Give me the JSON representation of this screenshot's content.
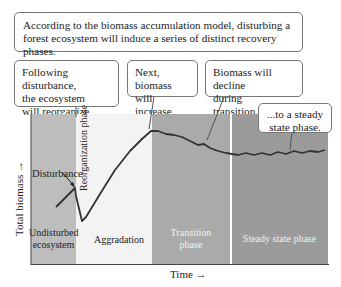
{
  "intro_box": {
    "text": "According to the biomass accumulation model, disturbing a forest ecosystem will induce a series of distinct recovery phases."
  },
  "callouts": [
    {
      "id": "reorganize",
      "lines": [
        "Following disturbance,",
        "the ecosystem",
        "will reorganize."
      ]
    },
    {
      "id": "increase",
      "lines": [
        "Next, biomass",
        "will increase."
      ]
    },
    {
      "id": "decline",
      "lines": [
        "Biomass will decline",
        "during transition..."
      ]
    },
    {
      "id": "steady",
      "lines": [
        "...to a steady",
        "state phase."
      ]
    }
  ],
  "axes": {
    "y_label": "Total biomass →",
    "x_label": "Time →"
  },
  "annotations": {
    "disturbance": "Disturbance"
  },
  "phases": [
    {
      "name": "Undisturbed ecosystem",
      "lines": [
        "Undisturbed",
        "ecosystem"
      ],
      "color": "#bdbdbd",
      "text_color": "#222222"
    },
    {
      "name": "Reorganization phase",
      "lines": [
        "Reorganization phase"
      ],
      "color": "#f2f2f2",
      "text_color": "#222222"
    },
    {
      "name": "Aggradation",
      "lines": [
        "Aggradation"
      ],
      "color": "#f2f2f2",
      "text_color": "#222222"
    },
    {
      "name": "Transition phase",
      "lines": [
        "Transition",
        "phase"
      ],
      "color": "#a9a9a9",
      "text_color": "#f2f2f2"
    },
    {
      "name": "Steady state phase",
      "lines": [
        "Steady state phase"
      ],
      "color": "#9a9a9a",
      "text_color": "#f2f2f2"
    }
  ],
  "colors": {
    "curve": "#333333",
    "border": "#777777"
  }
}
